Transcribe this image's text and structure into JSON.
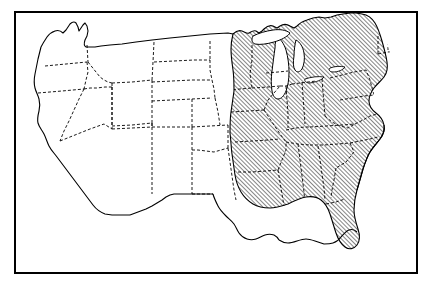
{
  "figure": {
    "kind": "map",
    "title": "",
    "caption": "",
    "region": "United States (contiguous 48 states)",
    "projection": "generic conic / albers-like",
    "background_color": "#ffffff",
    "ink_color": "#000000"
  },
  "frame": {
    "name": "map-border-frame",
    "visible": true,
    "x": 14,
    "y": 11,
    "width": 404,
    "height": 263,
    "stroke_color": "#000000",
    "stroke_width": 2
  },
  "legend": {
    "present": false,
    "entries": [
      {
        "label": "",
        "pattern": "diagonal-hatch",
        "meaning": "highlighted / shaded region"
      },
      {
        "label": "",
        "pattern": "none",
        "meaning": "unshaded region"
      }
    ]
  },
  "line_styles": {
    "coastline": {
      "name": "coastline",
      "dash": "solid",
      "stroke_width": 1.1,
      "color": "#000000"
    },
    "national_border": {
      "name": "national-border",
      "dash": "solid",
      "stroke_width": 1.0,
      "color": "#000000"
    },
    "state_border": {
      "name": "state-border",
      "dash": "dashed",
      "dash_array": "3,2",
      "stroke_width": 0.9,
      "color": "#000000"
    }
  },
  "hatch": {
    "name": "diagonal-hatch-pattern",
    "angle_degrees": 45,
    "direction": "lower-left to upper-right",
    "spacing_px": 3,
    "stroke_width": 0.9,
    "color": "#000000"
  },
  "shaded_states": [
    "Minnesota",
    "Wisconsin",
    "Michigan",
    "Iowa",
    "Illinois",
    "Indiana",
    "Ohio",
    "Missouri",
    "Kentucky",
    "Tennessee",
    "Arkansas",
    "Louisiana",
    "Mississippi",
    "Alabama",
    "Georgia",
    "Florida",
    "South Carolina",
    "North Carolina",
    "Virginia",
    "West Virginia",
    "Maryland",
    "Delaware",
    "Pennsylvania",
    "New Jersey",
    "New York",
    "Connecticut",
    "Rhode Island",
    "Massachusetts",
    "Vermont",
    "New Hampshire",
    "Maine"
  ],
  "unshaded_states": [
    "Washington",
    "Oregon",
    "California",
    "Idaho",
    "Nevada",
    "Montana",
    "Wyoming",
    "Utah",
    "Arizona",
    "Colorado",
    "New Mexico",
    "North Dakota",
    "South Dakota",
    "Nebraska",
    "Kansas",
    "Oklahoma",
    "Texas"
  ],
  "water_features": [
    {
      "name": "Lake Michigan",
      "shaded": false
    },
    {
      "name": "Lake Superior",
      "shaded": false
    },
    {
      "name": "Lake Huron",
      "shaded": false
    },
    {
      "name": "Lake Erie",
      "shaded": false
    },
    {
      "name": "Lake Ontario",
      "shaded": false
    }
  ],
  "labels": []
}
